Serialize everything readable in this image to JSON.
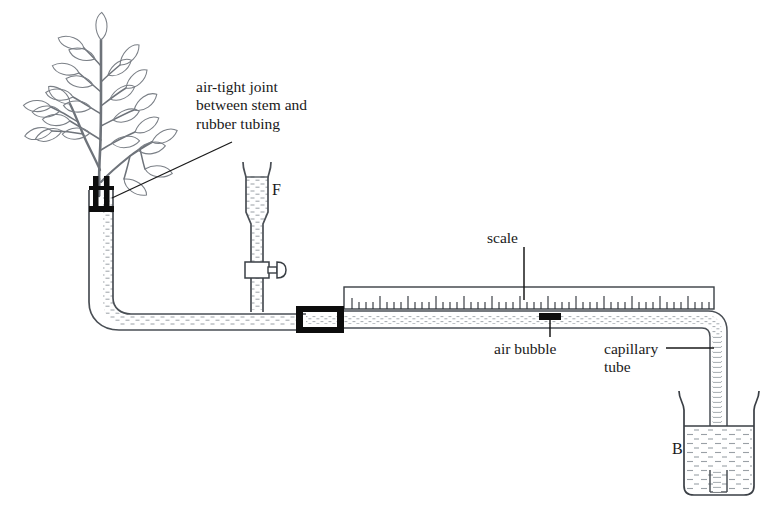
{
  "diagram": {
    "background_color": "#ffffff",
    "ink_color": "#1a1a1a",
    "leaf_stroke_color": "#7a7f86",
    "rubber_color": "#0d0d0d",
    "hatch_color": "#9aa0a6"
  },
  "labels": {
    "joint": "air-tight joint\nbetween stem and\nrubber tubing",
    "reservoir": "F",
    "scale": "scale",
    "air_bubble": "air bubble",
    "capillary": "capillary\ntube",
    "beaker": "B"
  },
  "parts": {
    "plant": {
      "name": "leafy-shoot",
      "leaf_count": 26,
      "branch_count": 8
    },
    "stem_joint": {
      "name": "air-tight-joint",
      "rubber_band_count": 2,
      "color": "#0d0d0d"
    },
    "vertical_tube": {
      "name": "water-filled-tube",
      "contents": "water"
    },
    "reservoir_F": {
      "name": "reservoir-funnel",
      "has_stopcock": true,
      "stopcock_label": "tap",
      "contents": "water"
    },
    "scale_ruler": {
      "name": "graduated-scale",
      "major_tick_count": 11,
      "minor_tick_count": 44,
      "units": "mm"
    },
    "capillary_tube": {
      "name": "capillary-tube",
      "contents": "water"
    },
    "air_bubble": {
      "name": "air-bubble-marker",
      "color": "#0d0d0d"
    },
    "rubber_connector": {
      "name": "rubber-connector",
      "color": "#0d0d0d"
    },
    "beaker_B": {
      "name": "water-beaker",
      "contents": "water"
    }
  }
}
